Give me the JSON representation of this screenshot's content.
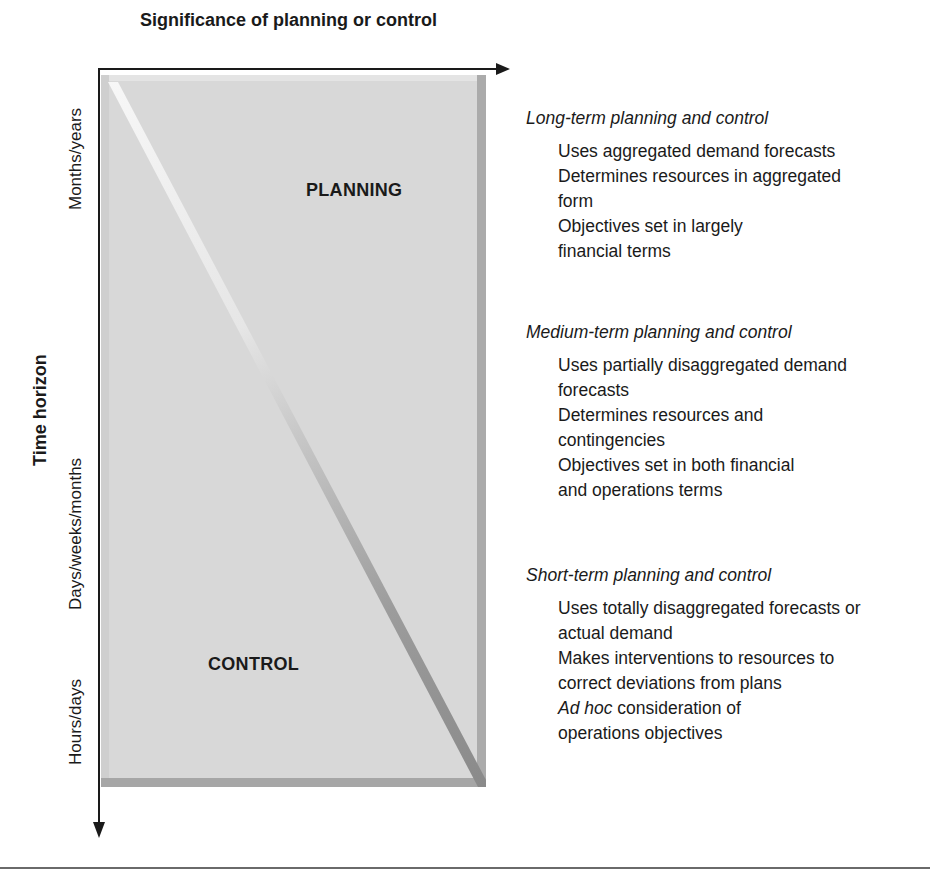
{
  "diagram": {
    "x_axis_title": "Significance of planning or control",
    "y_axis_title": "Time horizon",
    "time_scale_labels": [
      "Months/years",
      "Days/weeks/months",
      "Hours/days"
    ],
    "regions": {
      "upper": "PLANNING",
      "lower": "CONTROL"
    },
    "colors": {
      "box_fill": "#d6d6d6",
      "box_border": "#a9a9a9",
      "diagonal_light": "#f2f2f2",
      "diagonal_dark": "#8e8e8e",
      "axis": "#1a1a1a",
      "text": "#1a1a1a"
    }
  },
  "panels": [
    {
      "heading": "Long-term planning and control",
      "items": [
        "Uses aggregated demand forecasts",
        "Determines resources in aggregated form",
        "Objectives set in largely financial terms"
      ]
    },
    {
      "heading": "Medium-term planning and control",
      "items": [
        "Uses partially disaggregated demand forecasts",
        "Determines resources and contingencies",
        "Objectives set in both financial and operations terms"
      ]
    },
    {
      "heading": "Short-term planning and control",
      "items": [
        "Uses totally disaggregated forecasts or actual demand",
        "Makes interventions to resources to correct deviations from plans",
        {
          "italic": "Ad hoc",
          "rest": " consideration of operations objectives"
        }
      ]
    }
  ]
}
